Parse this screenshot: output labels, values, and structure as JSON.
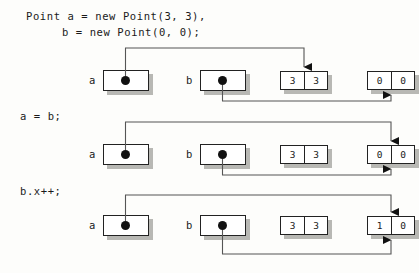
{
  "figure": {
    "type": "object-reference-diagram",
    "code": {
      "line1": "Point a = new Point(3, 3),",
      "line2": "b = new Point(0, 0);"
    },
    "rows": [
      {
        "statement": "",
        "vars": [
          {
            "name": "a",
            "points_to": "object-33"
          },
          {
            "name": "b",
            "points_to": "object-00"
          }
        ],
        "objects": [
          {
            "id": "object-33",
            "cells": [
              "3",
              "3"
            ]
          },
          {
            "id": "object-00",
            "cells": [
              "0",
              "0"
            ]
          }
        ]
      },
      {
        "statement": "a = b;",
        "vars": [
          {
            "name": "a",
            "points_to": "object-00"
          },
          {
            "name": "b",
            "points_to": "object-00"
          }
        ],
        "objects": [
          {
            "id": "object-33",
            "cells": [
              "3",
              "3"
            ]
          },
          {
            "id": "object-00",
            "cells": [
              "0",
              "0"
            ]
          }
        ]
      },
      {
        "statement": "b.x++;",
        "vars": [
          {
            "name": "a",
            "points_to": "object-10"
          },
          {
            "name": "b",
            "points_to": "object-10"
          }
        ],
        "objects": [
          {
            "id": "object-33",
            "cells": [
              "3",
              "3"
            ]
          },
          {
            "id": "object-10",
            "cells": [
              "1",
              "0"
            ]
          }
        ]
      }
    ],
    "colors": {
      "background": "#fdfdfb",
      "ink": "#1a1a1a",
      "box_border": "#222222",
      "shadow": "#b8b8b4",
      "dot": "#111111"
    }
  }
}
